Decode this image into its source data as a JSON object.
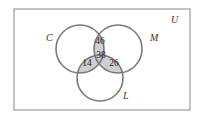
{
  "diagram": {
    "type": "venn",
    "universe_label": "U",
    "sets": [
      {
        "label": "C"
      },
      {
        "label": "M"
      },
      {
        "label": "L"
      }
    ],
    "regions": {
      "C_and_M_only": "46",
      "C_and_M_and_L": "38",
      "C_and_L_only": "14",
      "M_and_L_only": "26"
    },
    "colors": {
      "circle_stroke": "#7a7a7a",
      "shaded_region": "#cfcfcf",
      "frame": "#888888"
    }
  }
}
